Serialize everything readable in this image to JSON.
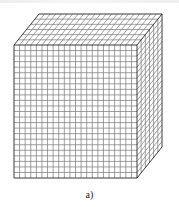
{
  "figure": {
    "caption": "a)",
    "colors": {
      "line": "#3a3a3a",
      "grid": "#777777",
      "background": "#ffffff"
    },
    "cube": {
      "front": {
        "x0": 14,
        "y0": 45,
        "x1": 137,
        "y1": 178
      },
      "depth_offset": {
        "dx": 25,
        "dy": -31
      },
      "front_cols": 22,
      "front_rows": 24,
      "depth_cells": 6
    }
  }
}
